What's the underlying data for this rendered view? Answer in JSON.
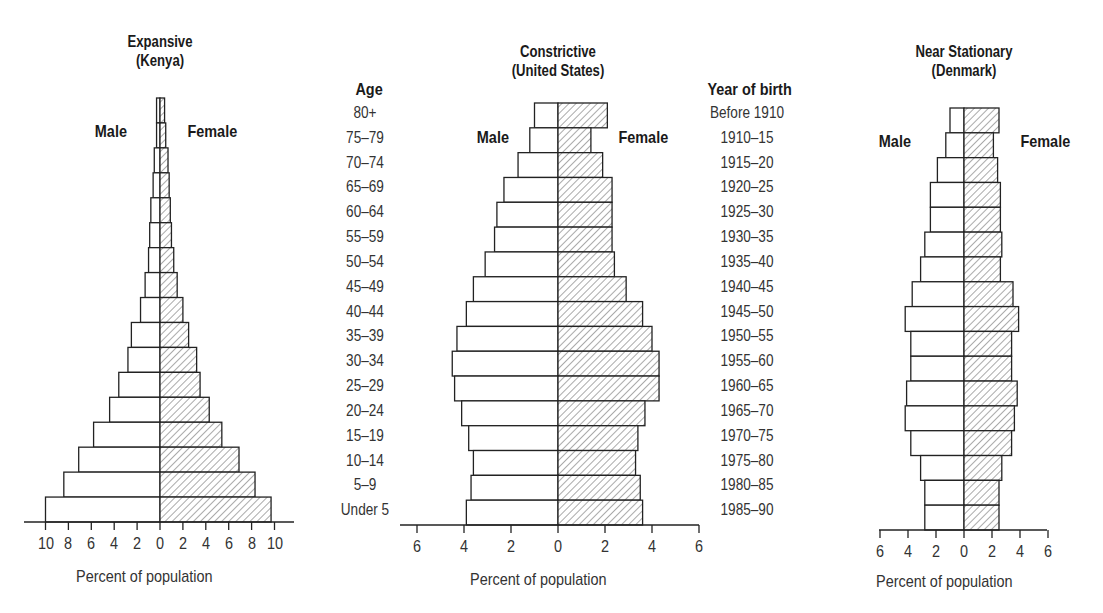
{
  "chart_data": [
    {
      "type": "bar",
      "orientation": "horizontal-population-pyramid",
      "title": "Expansive (Kenya)",
      "title_line1": "Expansive",
      "title_line2": "(Kenya)",
      "left_label": "Male",
      "right_label": "Female",
      "xlabel": "Percent of population",
      "xticks_left": [
        "10",
        "8",
        "6",
        "4",
        "2"
      ],
      "xticks_right": [
        "0",
        "2",
        "4",
        "6",
        "8",
        "10"
      ],
      "xlim": [
        -10,
        10
      ],
      "categories": [
        "80+",
        "75–79",
        "70–74",
        "65–69",
        "60–64",
        "55–59",
        "50–54",
        "45–49",
        "40–44",
        "35–39",
        "30–34",
        "25–29",
        "20–24",
        "15–19",
        "10–14",
        "5–9",
        "Under 5"
      ],
      "series": [
        {
          "name": "Male",
          "values": [
            0.3,
            0.3,
            0.5,
            0.6,
            0.8,
            0.9,
            1.0,
            1.3,
            1.7,
            2.5,
            2.8,
            3.6,
            4.4,
            5.8,
            7.1,
            8.4,
            10.0
          ]
        },
        {
          "name": "Female",
          "values": [
            0.4,
            0.5,
            0.7,
            0.8,
            0.9,
            1.0,
            1.2,
            1.5,
            2.0,
            2.5,
            3.2,
            3.5,
            4.3,
            5.4,
            6.9,
            8.3,
            9.7
          ]
        }
      ]
    },
    {
      "type": "bar",
      "orientation": "horizontal-population-pyramid",
      "title": "Constrictive (United States)",
      "title_line1": "Constrictive",
      "title_line2": "(United States)",
      "left_label": "Male",
      "right_label": "Female",
      "age_header": "Age",
      "year_header": "Year of birth",
      "xlabel": "Percent of population",
      "xticks_left": [
        "6",
        "4",
        "2"
      ],
      "xticks_right": [
        "0",
        "2",
        "4",
        "6"
      ],
      "xlim": [
        -6,
        6
      ],
      "categories": [
        "80+",
        "75–79",
        "70–74",
        "65–69",
        "60–64",
        "55–59",
        "50–54",
        "45–49",
        "40–44",
        "35–39",
        "30–34",
        "25–29",
        "20–24",
        "15–19",
        "10–14",
        "5–9",
        "Under 5"
      ],
      "year_of_birth": [
        "Before 1910",
        "1910–15",
        "1915–20",
        "1920–25",
        "1925–30",
        "1930–35",
        "1935–40",
        "1940–45",
        "1945–50",
        "1950–55",
        "1955–60",
        "1960–65",
        "1965–70",
        "1970–75",
        "1975–80",
        "1980–85",
        "1985–90"
      ],
      "series": [
        {
          "name": "Male",
          "values": [
            1.0,
            1.2,
            1.7,
            2.3,
            2.6,
            2.7,
            3.1,
            3.6,
            3.9,
            4.3,
            4.5,
            4.4,
            4.1,
            3.8,
            3.6,
            3.7,
            3.9
          ]
        },
        {
          "name": "Female",
          "values": [
            2.1,
            1.4,
            1.9,
            2.3,
            2.3,
            2.3,
            2.4,
            2.9,
            3.6,
            4.0,
            4.3,
            4.3,
            3.7,
            3.4,
            3.3,
            3.5,
            3.6
          ]
        }
      ]
    },
    {
      "type": "bar",
      "orientation": "horizontal-population-pyramid",
      "title": "Near Stationary (Denmark)",
      "title_line1": "Near Stationary",
      "title_line2": "(Denmark)",
      "left_label": "Male",
      "right_label": "Female",
      "xlabel": "Percent of population",
      "xticks_left": [
        "6",
        "4",
        "2"
      ],
      "xticks_right": [
        "0",
        "2",
        "4",
        "6"
      ],
      "xlim": [
        -6,
        6
      ],
      "categories": [
        "80+",
        "75–79",
        "70–74",
        "65–69",
        "60–64",
        "55–59",
        "50–54",
        "45–49",
        "40–44",
        "35–39",
        "30–34",
        "25–29",
        "20–24",
        "15–19",
        "10–14",
        "5–9",
        "Under 5"
      ],
      "series": [
        {
          "name": "Male",
          "values": [
            1.0,
            1.3,
            1.9,
            2.4,
            2.4,
            2.8,
            3.1,
            3.7,
            4.2,
            3.8,
            3.8,
            4.1,
            4.2,
            3.8,
            3.1,
            2.8,
            2.8
          ]
        },
        {
          "name": "Female",
          "values": [
            2.5,
            2.1,
            2.4,
            2.6,
            2.6,
            2.7,
            2.6,
            3.5,
            3.9,
            3.4,
            3.4,
            3.8,
            3.6,
            3.4,
            2.7,
            2.5,
            2.5
          ]
        }
      ]
    }
  ]
}
